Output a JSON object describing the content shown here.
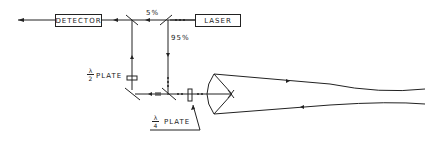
{
  "diagram": {
    "components": {
      "detector": "DETECTOR",
      "laser": "LASER"
    },
    "labels": {
      "split_5": "5%",
      "split_95": "95%",
      "half_wave_plate": {
        "numerator": "λ",
        "denominator": "2",
        "text": "PLATE"
      },
      "quarter_wave_plate": {
        "numerator": "λ",
        "denominator": "4",
        "text": "PLATE"
      }
    },
    "colors": {
      "line": "#222222",
      "background": "#ffffff"
    }
  }
}
